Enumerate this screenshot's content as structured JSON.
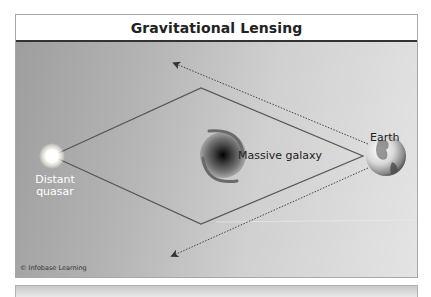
{
  "figure": {
    "title": "Gravitational Lensing",
    "labels": {
      "quasar": "Distant quasar",
      "quasar_line1": "Distant",
      "quasar_line2": "quasar",
      "galaxy": "Massive galaxy",
      "earth": "Earth"
    },
    "credit": "© Infobase Learning",
    "colors": {
      "panel_dark": "#9e9e9e",
      "panel_light": "#e4e4e4",
      "light_path": "#5a5a5a",
      "apparent_path": "#444444",
      "title_text": "#222222"
    },
    "elements": [
      {
        "name": "distant-quasar",
        "type": "light-source"
      },
      {
        "name": "massive-galaxy",
        "type": "lens"
      },
      {
        "name": "earth",
        "type": "observer"
      },
      {
        "name": "bent-light-paths",
        "type": "solid-lines",
        "count": 4
      },
      {
        "name": "apparent-image-directions",
        "type": "dotted-arrows",
        "count": 2
      }
    ]
  }
}
